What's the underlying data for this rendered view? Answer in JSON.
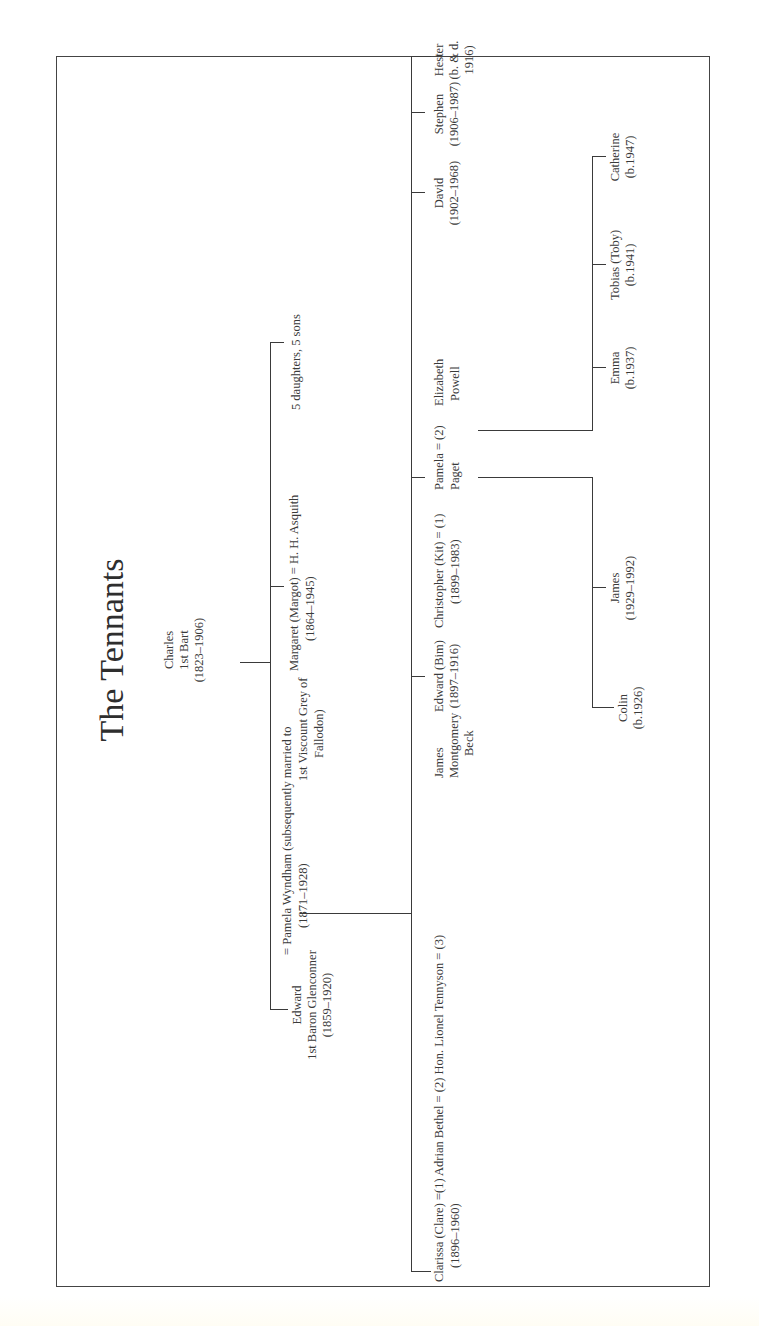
{
  "title": "The Tennants",
  "generation1": {
    "charles": {
      "name": "Charles",
      "title": "1st Bart",
      "dates": "(1823–1906)"
    }
  },
  "generation2": {
    "edward": {
      "name": "Edward",
      "title": "1st Baron Glenconner",
      "dates": "(1859–1920)"
    },
    "pamela_wyndham": {
      "line1": "= Pamela Wyndham (subsequently married to",
      "line2_dates": "(1871–1928)",
      "line2_rest": "1st Viscount Grey of",
      "line3": "Fallodon)"
    },
    "margaret": {
      "name": "Margaret (Margot) = H. H. Asquith",
      "dates": "(1864–1945)"
    },
    "others": {
      "label": "5 daughters, 5 sons"
    }
  },
  "generation3": {
    "clarissa": {
      "name": "Clarissa (Clare) =(1)  Adrian Bethel = (2)  Hon. Lionel Tennyson = (3)",
      "dates": "(1896–1960)"
    },
    "james_beck": {
      "line1": "James",
      "line2": "Montgomery",
      "line3": "Beck"
    },
    "edward_bim": {
      "name": "Edward (Bim)",
      "dates": "(1897–1916)"
    },
    "christopher": {
      "name": "Christopher (Kit) = (1)",
      "dates": "(1899–1983)"
    },
    "pamela_paget": {
      "line1": "Pamela = (2)",
      "line2": "Paget"
    },
    "elizabeth_powell": {
      "line1": "Elizabeth",
      "line2": "Powell"
    },
    "david": {
      "name": "David",
      "dates": "(1902–1968)"
    },
    "stephen": {
      "name": "Stephen",
      "dates": "(1906–1987)"
    },
    "hester": {
      "name": "Hester",
      "dates": "(b. & d.",
      "dates2": "1916)"
    }
  },
  "generation4": {
    "colin": {
      "name": "Colin",
      "dates": "(b.1926)"
    },
    "james": {
      "name": "James",
      "dates": "(1929–1992)"
    },
    "emma": {
      "name": "Emma",
      "dates": "(b.1937)"
    },
    "tobias": {
      "name": "Tobias (Toby)",
      "dates": "(b.1941)"
    },
    "catherine": {
      "name": "Catherine",
      "dates": "(b.1947)"
    }
  }
}
